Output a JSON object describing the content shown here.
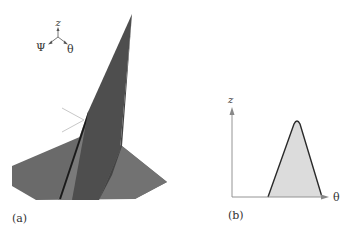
{
  "figure": {
    "panel_a": {
      "caption": "(a)",
      "axes_triad": {
        "up_label": "z",
        "left_label": "Ψ",
        "right_label": "θ"
      },
      "colors": {
        "base_plane": "#6a6a6a",
        "fin_dark": "#4a4a4a",
        "fin_light": "#5c5c5c",
        "fin_edge": "#1a1a1a",
        "light_ray": "#c8c8c8"
      }
    },
    "panel_b": {
      "caption": "(b)",
      "y_axis_label": "z",
      "x_axis_label": "θ",
      "colors": {
        "fill": "#dcdcdc",
        "outline": "#2a2a2a",
        "axis": "#888888"
      }
    }
  }
}
